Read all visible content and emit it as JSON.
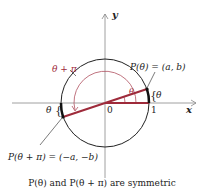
{
  "figure": {
    "axis_labels": {
      "x": "x",
      "y": "y"
    },
    "origin_label": "0",
    "one_label": "1",
    "angle_label_theta": "θ",
    "angle_label_theta_plus_pi": "θ + π",
    "point_p": "P(θ) = (a, b)",
    "point_p_pi": "P(θ + π) = (−a, −b)",
    "arc_theta_right": "θ",
    "arc_theta_left": "θ",
    "caption": "P(θ) and P(θ + π) are symmetric"
  },
  "colors": {
    "accent": "#9e2a3a",
    "line": "#222222",
    "arc": "#b05060"
  }
}
